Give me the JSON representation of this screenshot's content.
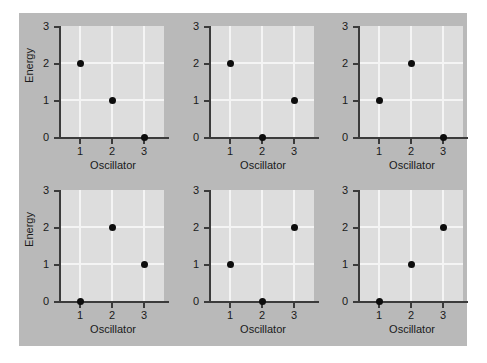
{
  "figure": {
    "background_color": "#b9b9b9",
    "plot_background_color": "#dddddd",
    "grid_color": "#f4f4f4",
    "axis_color": "#3b3b3b",
    "marker_color": "#0d0d0d"
  },
  "chart_data": [
    {
      "type": "scatter",
      "title": "",
      "xlabel": "Oscillator",
      "ylabel": "Energy",
      "x": [
        1,
        2,
        3
      ],
      "values": [
        2,
        1,
        0
      ],
      "xticks": [
        "1",
        "2",
        "3"
      ],
      "yticks": [
        "0",
        "1",
        "2",
        "3"
      ],
      "xlim": [
        0.4,
        3.6
      ],
      "ylim": [
        0,
        3
      ],
      "grid": true,
      "legend": "none"
    },
    {
      "type": "scatter",
      "title": "",
      "xlabel": "Oscillator",
      "ylabel": "",
      "x": [
        1,
        2,
        3
      ],
      "values": [
        2,
        0,
        1
      ],
      "xticks": [
        "1",
        "2",
        "3"
      ],
      "yticks": [
        "0",
        "1",
        "2",
        "3"
      ],
      "xlim": [
        0.4,
        3.6
      ],
      "ylim": [
        0,
        3
      ],
      "grid": true,
      "legend": "none"
    },
    {
      "type": "scatter",
      "title": "",
      "xlabel": "Oscillator",
      "ylabel": "",
      "x": [
        1,
        2,
        3
      ],
      "values": [
        1,
        2,
        0
      ],
      "xticks": [
        "1",
        "2",
        "3"
      ],
      "yticks": [
        "0",
        "1",
        "2",
        "3"
      ],
      "xlim": [
        0.4,
        3.6
      ],
      "ylim": [
        0,
        3
      ],
      "grid": true,
      "legend": "none"
    },
    {
      "type": "scatter",
      "title": "",
      "xlabel": "Oscillator",
      "ylabel": "Energy",
      "x": [
        1,
        2,
        3
      ],
      "values": [
        0,
        2,
        1
      ],
      "xticks": [
        "1",
        "2",
        "3"
      ],
      "yticks": [
        "0",
        "1",
        "2",
        "3"
      ],
      "xlim": [
        0.4,
        3.6
      ],
      "ylim": [
        0,
        3
      ],
      "grid": true,
      "legend": "none"
    },
    {
      "type": "scatter",
      "title": "",
      "xlabel": "Oscillator",
      "ylabel": "",
      "x": [
        1,
        2,
        3
      ],
      "values": [
        1,
        0,
        2
      ],
      "xticks": [
        "1",
        "2",
        "3"
      ],
      "yticks": [
        "0",
        "1",
        "2",
        "3"
      ],
      "xlim": [
        0.4,
        3.6
      ],
      "ylim": [
        0,
        3
      ],
      "grid": true,
      "legend": "none"
    },
    {
      "type": "scatter",
      "title": "",
      "xlabel": "Oscillator",
      "ylabel": "",
      "x": [
        1,
        2,
        3
      ],
      "values": [
        0,
        1,
        2
      ],
      "xticks": [
        "1",
        "2",
        "3"
      ],
      "yticks": [
        "0",
        "1",
        "2",
        "3"
      ],
      "xlim": [
        0.4,
        3.6
      ],
      "ylim": [
        0,
        3
      ],
      "grid": true,
      "legend": "none"
    }
  ]
}
